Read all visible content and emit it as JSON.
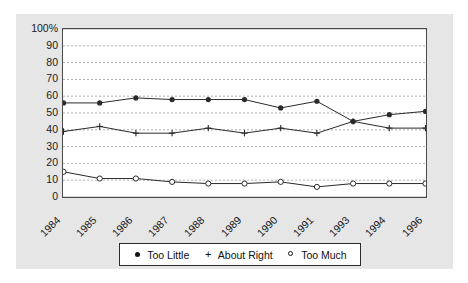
{
  "chart_data": {
    "type": "line",
    "title": "",
    "xlabel": "",
    "ylabel": "",
    "categories": [
      "1984",
      "1985",
      "1986",
      "1987",
      "1988",
      "1989",
      "1990",
      "1991",
      "1993",
      "1994",
      "1996"
    ],
    "ylim": [
      0,
      100
    ],
    "yticks": [
      "0",
      "10",
      "20",
      "30",
      "40",
      "50",
      "60",
      "70",
      "80",
      "90",
      "100%"
    ],
    "grid": true,
    "legend_position": "bottom",
    "series": [
      {
        "name": "Too Little",
        "marker": "filled-circle",
        "values": [
          56,
          56,
          59,
          58,
          58,
          58,
          53,
          57,
          45,
          49,
          51
        ]
      },
      {
        "name": "About Right",
        "marker": "plus",
        "values": [
          39,
          42,
          38,
          38,
          41,
          38,
          41,
          38,
          45,
          41,
          41
        ]
      },
      {
        "name": "Too Much",
        "marker": "open-circle",
        "values": [
          15,
          11,
          11,
          9,
          8,
          8,
          9,
          6,
          8,
          8,
          8
        ]
      }
    ]
  },
  "colors": {
    "panel_background": "#e6e6e6",
    "plot_background": "#ffffff",
    "axis": "#4a4a4a",
    "gridline": "#9a9a9a",
    "series_line": "#2a2a2a",
    "text": "#1a1a1a",
    "legend_border": "#2b2b2b"
  },
  "legend": {
    "items": [
      {
        "label": "Too Little",
        "marker": "filled-circle-icon"
      },
      {
        "label": "About Right",
        "marker": "plus-icon"
      },
      {
        "label": "Too Much",
        "marker": "open-circle-icon"
      }
    ]
  }
}
